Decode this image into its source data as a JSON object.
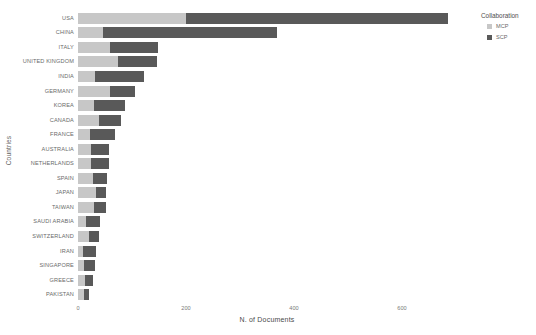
{
  "chart_data": {
    "type": "bar",
    "orientation": "horizontal",
    "stacked": true,
    "title": "",
    "xlabel": "N. of Documents",
    "ylabel": "Countries",
    "xlim": [
      0,
      700
    ],
    "xticks": [
      0,
      200,
      400,
      600
    ],
    "xtick_labels": [
      "0",
      "200",
      "400",
      "600"
    ],
    "grid": false,
    "legend": {
      "title": "Collaboration",
      "position": "right",
      "entries": [
        {
          "name": "MCP",
          "color": "#c7c7c7"
        },
        {
          "name": "SCP",
          "color": "#595959"
        }
      ]
    },
    "categories": [
      "USA",
      "CHINA",
      "ITALY",
      "UNITED KINGDOM",
      "INDIA",
      "GERMANY",
      "KOREA",
      "CANADA",
      "FRANCE",
      "AUSTRALIA",
      "NETHERLANDS",
      "SPAIN",
      "JAPAN",
      "TAIWAN",
      "SAUDI ARABIA",
      "SWITZERLAND",
      "IRAN",
      "SINGAPORE",
      "GREECE",
      "PAKISTAN"
    ],
    "series": [
      {
        "name": "MCP",
        "color": "#c7c7c7",
        "values": [
          200,
          47,
          60,
          74,
          31,
          59,
          29,
          38,
          22,
          24,
          24,
          28,
          34,
          30,
          14,
          20,
          9,
          12,
          13,
          12
        ]
      },
      {
        "name": "SCP",
        "color": "#595959",
        "values": [
          486,
          322,
          89,
          72,
          91,
          46,
          58,
          41,
          46,
          33,
          33,
          25,
          18,
          21,
          26,
          18,
          25,
          19,
          14,
          9
        ]
      }
    ],
    "totals": [
      686,
      369,
      149,
      146,
      122,
      105,
      87,
      79,
      68,
      57,
      57,
      53,
      52,
      51,
      40,
      38,
      34,
      31,
      27,
      21
    ]
  },
  "colors": {
    "mcp": "#c7c7c7",
    "scp": "#595959",
    "background": "#ffffff",
    "tick_text": "#6a6a6a",
    "axis_title": "#4a4a4a"
  }
}
